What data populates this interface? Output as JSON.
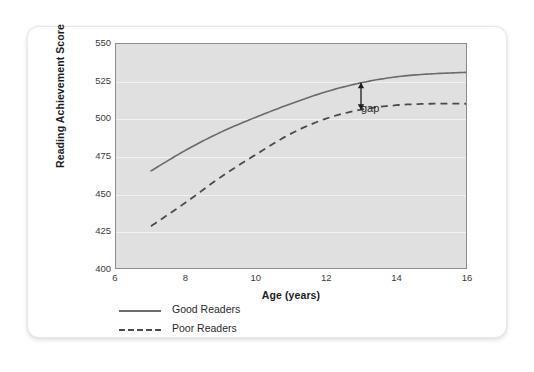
{
  "chart_data": {
    "type": "line",
    "title": "",
    "xlabel": "Age (years)",
    "ylabel": "Reading Achievement Score",
    "xlim": [
      6,
      16
    ],
    "ylim": [
      400,
      550
    ],
    "xticks": [
      6,
      8,
      10,
      12,
      14,
      16
    ],
    "yticks": [
      400,
      425,
      450,
      475,
      500,
      525,
      550
    ],
    "grid": "horizontal",
    "legend_position": "below-left",
    "panel_background": "#e0e0e0",
    "series": [
      {
        "name": "Good Readers",
        "style": "solid",
        "color": "#6a6a6a",
        "x": [
          7,
          8,
          9,
          10,
          11,
          12,
          13,
          14,
          15,
          16
        ],
        "values": [
          465,
          479,
          491,
          501,
          510,
          518,
          524,
          528,
          530,
          531
        ]
      },
      {
        "name": "Poor Readers",
        "style": "dashed",
        "color": "#4a4a4a",
        "x": [
          7,
          8,
          9,
          10,
          11,
          12,
          13,
          14,
          15,
          16
        ],
        "values": [
          428,
          444,
          461,
          476,
          490,
          500,
          506,
          509,
          510,
          510
        ]
      }
    ],
    "annotations": [
      {
        "name": "gap",
        "label": "gap",
        "type": "double-arrow",
        "x": 13,
        "y_top": 524,
        "y_bottom": 506,
        "label_x": 13.35,
        "label_y": 515
      }
    ]
  },
  "axes": {
    "ylabel": "Reading Achievement Score",
    "xlabel": "Age (years)",
    "yticks": [
      "550",
      "525",
      "500",
      "475",
      "450",
      "425",
      "400"
    ],
    "xticks": [
      "6",
      "8",
      "10",
      "12",
      "14",
      "16"
    ]
  },
  "legend": {
    "items": [
      {
        "label": "Good Readers",
        "style": "solid"
      },
      {
        "label": "Poor Readers",
        "style": "dashed"
      }
    ]
  },
  "annotation": {
    "gap_label": "gap"
  }
}
